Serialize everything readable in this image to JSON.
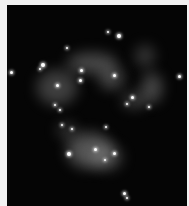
{
  "image": {
    "subject": "galaxy",
    "background_color": "#050505",
    "border_color": "#f2f2f2",
    "glows": [
      {
        "x": 60,
        "y": 48,
        "w": 50,
        "h": 20,
        "o": 0.35
      },
      {
        "x": 30,
        "y": 65,
        "w": 40,
        "h": 35,
        "o": 0.3
      },
      {
        "x": 92,
        "y": 62,
        "w": 25,
        "h": 22,
        "o": 0.35
      },
      {
        "x": 128,
        "y": 40,
        "w": 20,
        "h": 22,
        "o": 0.25
      },
      {
        "x": 135,
        "y": 68,
        "w": 20,
        "h": 30,
        "o": 0.35
      },
      {
        "x": 115,
        "y": 88,
        "w": 25,
        "h": 15,
        "o": 0.3
      },
      {
        "x": 60,
        "y": 128,
        "w": 45,
        "h": 35,
        "o": 0.4
      },
      {
        "x": 85,
        "y": 140,
        "w": 30,
        "h": 25,
        "o": 0.3
      },
      {
        "x": 50,
        "y": 118,
        "w": 20,
        "h": 15,
        "o": 0.25
      }
    ],
    "stars": [
      {
        "x": 112,
        "y": 31,
        "s": 4
      },
      {
        "x": 101,
        "y": 27,
        "s": 2
      },
      {
        "x": 60,
        "y": 43,
        "s": 2
      },
      {
        "x": 36,
        "y": 60,
        "s": 4
      },
      {
        "x": 33,
        "y": 64,
        "s": 2
      },
      {
        "x": 4,
        "y": 67,
        "s": 3
      },
      {
        "x": 74,
        "y": 65,
        "s": 3
      },
      {
        "x": 73,
        "y": 75,
        "s": 3
      },
      {
        "x": 107,
        "y": 70,
        "s": 3
      },
      {
        "x": 50,
        "y": 80,
        "s": 3
      },
      {
        "x": 172,
        "y": 71,
        "s": 3
      },
      {
        "x": 125,
        "y": 92,
        "s": 3
      },
      {
        "x": 120,
        "y": 99,
        "s": 2
      },
      {
        "x": 142,
        "y": 102,
        "s": 2
      },
      {
        "x": 48,
        "y": 100,
        "s": 2
      },
      {
        "x": 53,
        "y": 105,
        "s": 2
      },
      {
        "x": 65,
        "y": 124,
        "s": 2
      },
      {
        "x": 55,
        "y": 120,
        "s": 2
      },
      {
        "x": 99,
        "y": 122,
        "s": 2
      },
      {
        "x": 62,
        "y": 149,
        "s": 4
      },
      {
        "x": 88,
        "y": 144,
        "s": 3
      },
      {
        "x": 107,
        "y": 148,
        "s": 3
      },
      {
        "x": 98,
        "y": 155,
        "s": 2
      },
      {
        "x": 117,
        "y": 188,
        "s": 3
      },
      {
        "x": 120,
        "y": 193,
        "s": 2
      }
    ]
  }
}
